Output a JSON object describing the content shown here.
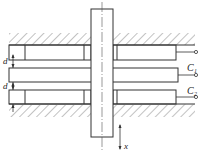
{
  "diagram": {
    "type": "differential-capacitor-schematic",
    "labels": {
      "gap_top": "d",
      "gap_bottom": "d",
      "capacitor_1": "C",
      "capacitor_1_sub": "1",
      "capacitor_2": "C",
      "capacitor_2_sub": "2",
      "displacement": "x"
    },
    "colors": {
      "line": "#333333",
      "hatch": "#666666",
      "background": "#ffffff"
    }
  }
}
